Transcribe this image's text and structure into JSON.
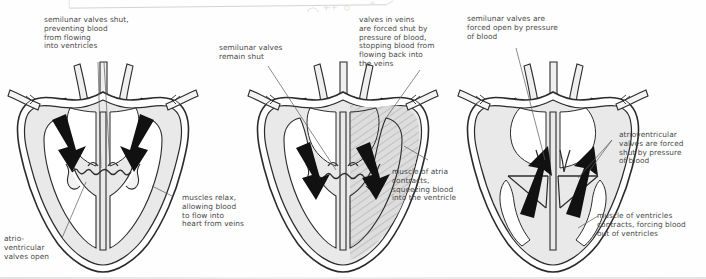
{
  "figure": {
    "background_color": "#fefefe",
    "ink_color": "#2b2b2b",
    "muscle_fill": "#e9e9e9",
    "shade_fill": "#d8d8d8",
    "label_color": "#4a4a4a",
    "arrow_color": "#111111"
  },
  "panels": [
    {
      "id": "panel-1",
      "name": "atrial-filling",
      "labels": [
        {
          "id": "label-semilunar-shut",
          "text": "semilunar valves shut,\npreventing blood\nfrom flowing\ninto ventricles"
        },
        {
          "id": "label-muscles-relax",
          "text": "muscles relax,\nallowing blood\nto flow into\nheart from veins"
        },
        {
          "id": "label-av-open",
          "text": "atrio-\nventricular\nvalves open"
        }
      ],
      "arrows": [
        {
          "id": "arrow-left-inflow",
          "direction": "down-right"
        },
        {
          "id": "arrow-right-inflow",
          "direction": "down-left"
        }
      ]
    },
    {
      "id": "panel-2",
      "name": "atrial-systole",
      "labels": [
        {
          "id": "label-semilunar-remain-shut",
          "text": "semilunar valves\nremain shut"
        },
        {
          "id": "label-vein-valves-shut",
          "text": "valves in veins\nare forced shut by\npressure of blood,\nstopping blood from\nflowing back into\nthe veins"
        },
        {
          "id": "label-atria-contract",
          "text": "muscle of atria\ncontracts,\nsqueezing blood\ninto the ventricle"
        }
      ],
      "arrows": [
        {
          "id": "arrow-left-into-ventricle",
          "direction": "down-right"
        },
        {
          "id": "arrow-right-into-ventricle",
          "direction": "down-right"
        }
      ]
    },
    {
      "id": "panel-3",
      "name": "ventricular-systole",
      "labels": [
        {
          "id": "label-semilunar-open",
          "text": "semilunar valves are\nforced open by pressure\nof blood"
        },
        {
          "id": "label-av-shut",
          "text": "atrioventricular\nvalves are forced\nshut by pressure\nof blood"
        },
        {
          "id": "label-ventricles-contract",
          "text": "muscle of ventricles\ncontracts, forcing blood\nout of ventricles"
        }
      ],
      "arrows": [
        {
          "id": "arrow-left-outflow",
          "direction": "up"
        },
        {
          "id": "arrow-right-outflow",
          "direction": "up"
        }
      ]
    }
  ]
}
